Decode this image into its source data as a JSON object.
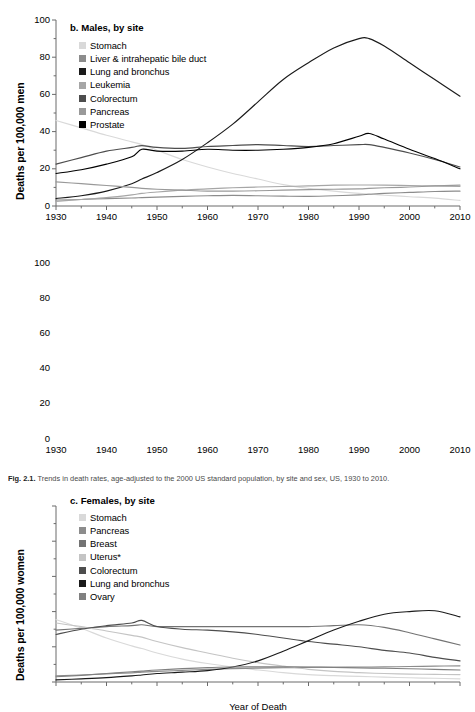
{
  "figure": {
    "caption_label": "Fig. 2.1.",
    "caption_text": "Trends in death rates, age-adjusted to the 2000 US standard population, by site and sex, US, 1930 to 2010."
  },
  "axes": {
    "x_title": "Year of Death",
    "x_ticks": [
      1930,
      1940,
      1950,
      1960,
      1970,
      1980,
      1990,
      2000,
      2010
    ],
    "x_tick_labels": [
      "1930",
      "1940",
      "1950",
      "1960",
      "1970",
      "1980",
      "1990",
      "2000",
      "2010"
    ],
    "x_minor_step": 5,
    "y_ticks": [
      0,
      20,
      40,
      60,
      80,
      100
    ],
    "y_tick_labels": [
      "0",
      "20",
      "40",
      "60",
      "80",
      "100"
    ],
    "y_minor_step": 10,
    "xlim": [
      1930,
      2010
    ],
    "ylim": [
      0,
      100
    ],
    "grid": false
  },
  "panels": {
    "males": {
      "title": "b. Males, by site",
      "ylabel": "Deaths per 100,000 men"
    },
    "females": {
      "title": "c. Females, by site",
      "ylabel": "Deaths per 100,000 women"
    }
  },
  "colors": {
    "stomach": "#d9d9d9",
    "liver": "#8c8c8c",
    "lung": "#1a1a1a",
    "leukemia": "#a6a6a6",
    "colorectum": "#4d4d4d",
    "pancreas": "#999999",
    "prostate": "#000000",
    "breast": "#737373",
    "uterus": "#c4c4c4",
    "ovary": "#808080",
    "axis": "#6b6b6b",
    "text": "#000000"
  },
  "chart_data": [
    {
      "type": "line",
      "title": "b. Males, by site",
      "xlabel": "Year of Death",
      "ylabel": "Deaths per 100,000 men",
      "xlim": [
        1930,
        2010
      ],
      "ylim": [
        0,
        100
      ],
      "grid": false,
      "legend_position": "top-left",
      "x": [
        1930,
        1935,
        1940,
        1945,
        1947,
        1950,
        1955,
        1960,
        1965,
        1970,
        1975,
        1980,
        1985,
        1990,
        1992,
        1995,
        2000,
        2005,
        2010
      ],
      "series": [
        {
          "name": "Stomach",
          "color": "#d9d9d9",
          "values": [
            46.0,
            42.0,
            38.0,
            34.5,
            33.0,
            30.0,
            25.0,
            21.0,
            17.5,
            14.5,
            11.5,
            9.5,
            8.0,
            6.8,
            6.5,
            5.8,
            5.0,
            4.2,
            3.0
          ]
        },
        {
          "name": "Liver & intrahepatic bile duct",
          "color": "#8c8c8c",
          "values": [
            3.2,
            3.5,
            4.0,
            4.3,
            4.5,
            4.8,
            5.2,
            5.5,
            5.7,
            5.5,
            5.3,
            5.2,
            5.5,
            6.0,
            6.3,
            6.8,
            7.3,
            7.8,
            8.0
          ]
        },
        {
          "name": "Lung and bronchus",
          "color": "#1a1a1a",
          "values": [
            4.0,
            5.5,
            8.0,
            12.0,
            14.5,
            18.0,
            25.0,
            34.0,
            44.0,
            56.0,
            68.0,
            77.0,
            85.0,
            90.0,
            90.0,
            86.0,
            77.0,
            68.0,
            59.0
          ]
        },
        {
          "name": "Leukemia",
          "color": "#a6a6a6",
          "values": [
            2.5,
            3.5,
            4.5,
            6.0,
            6.8,
            7.5,
            8.5,
            9.2,
            9.8,
            10.2,
            10.5,
            10.8,
            11.2,
            11.3,
            11.3,
            11.2,
            11.0,
            10.8,
            10.5
          ]
        },
        {
          "name": "Colorectum",
          "color": "#4d4d4d",
          "values": [
            22.5,
            26.0,
            29.5,
            31.5,
            32.5,
            31.5,
            31.0,
            32.0,
            32.5,
            33.0,
            32.5,
            32.0,
            32.5,
            33.0,
            33.0,
            31.5,
            28.5,
            25.0,
            21.0
          ]
        },
        {
          "name": "Pancreas",
          "color": "#999999",
          "values": [
            13.0,
            12.0,
            11.0,
            10.0,
            9.5,
            9.0,
            8.5,
            8.0,
            8.0,
            8.2,
            8.5,
            8.8,
            9.0,
            9.2,
            9.5,
            9.8,
            10.2,
            10.8,
            11.2
          ]
        },
        {
          "name": "Prostate",
          "color": "#000000",
          "values": [
            17.5,
            19.5,
            22.5,
            26.5,
            30.5,
            29.5,
            29.5,
            30.5,
            30.0,
            30.0,
            30.5,
            31.5,
            33.5,
            37.5,
            39.0,
            36.0,
            30.5,
            25.5,
            20.0
          ]
        }
      ]
    },
    {
      "type": "line",
      "title": "c. Females, by site",
      "xlabel": "Year of Death",
      "ylabel": "Deaths per 100,000 women",
      "xlim": [
        1930,
        2010
      ],
      "ylim": [
        0,
        100
      ],
      "grid": false,
      "legend_position": "top-left",
      "x": [
        1930,
        1935,
        1940,
        1945,
        1947,
        1950,
        1955,
        1960,
        1965,
        1970,
        1975,
        1980,
        1985,
        1990,
        1995,
        2000,
        2005,
        2010
      ],
      "series": [
        {
          "name": "Stomach",
          "color": "#d9d9d9",
          "values": [
            35.5,
            30.5,
            25.0,
            20.5,
            19.0,
            16.5,
            13.0,
            10.5,
            8.5,
            6.8,
            5.3,
            4.2,
            3.6,
            3.2,
            2.8,
            2.4,
            2.1,
            1.8
          ]
        },
        {
          "name": "Pancreas",
          "color": "#8c8c8c",
          "values": [
            3.5,
            4.0,
            4.6,
            5.2,
            5.6,
            6.0,
            6.6,
            7.2,
            7.6,
            7.9,
            8.1,
            8.3,
            8.4,
            8.5,
            8.6,
            8.8,
            9.0,
            9.2
          ]
        },
        {
          "name": "Breast",
          "color": "#737373",
          "values": [
            29.5,
            30.5,
            31.5,
            32.0,
            32.5,
            31.5,
            31.5,
            31.5,
            31.5,
            31.5,
            31.5,
            31.5,
            32.0,
            32.5,
            31.0,
            28.0,
            24.5,
            21.0
          ]
        },
        {
          "name": "Uterus*",
          "color": "#c4c4c4",
          "values": [
            33.5,
            31.5,
            29.0,
            26.5,
            25.5,
            23.0,
            19.5,
            16.5,
            13.5,
            11.0,
            9.0,
            7.2,
            6.0,
            5.3,
            4.8,
            4.5,
            4.3,
            4.2
          ]
        },
        {
          "name": "Colorectum",
          "color": "#4d4d4d",
          "values": [
            27.0,
            30.0,
            32.0,
            33.5,
            35.0,
            31.5,
            30.0,
            29.5,
            28.5,
            27.0,
            25.0,
            23.0,
            21.5,
            20.0,
            18.0,
            16.5,
            14.0,
            12.0
          ]
        },
        {
          "name": "Lung and bronchus",
          "color": "#1a1a1a",
          "values": [
            1.2,
            1.8,
            2.5,
            3.5,
            4.0,
            4.8,
            5.6,
            6.5,
            8.5,
            12.0,
            17.5,
            23.5,
            29.5,
            34.5,
            38.5,
            40.0,
            40.5,
            37.0
          ]
        },
        {
          "name": "Ovary",
          "color": "#808080",
          "values": [
            3.0,
            3.8,
            4.8,
            5.8,
            6.2,
            6.8,
            7.6,
            8.2,
            8.5,
            8.6,
            8.6,
            8.5,
            8.3,
            8.0,
            7.8,
            7.5,
            7.2,
            6.8
          ]
        }
      ]
    }
  ]
}
